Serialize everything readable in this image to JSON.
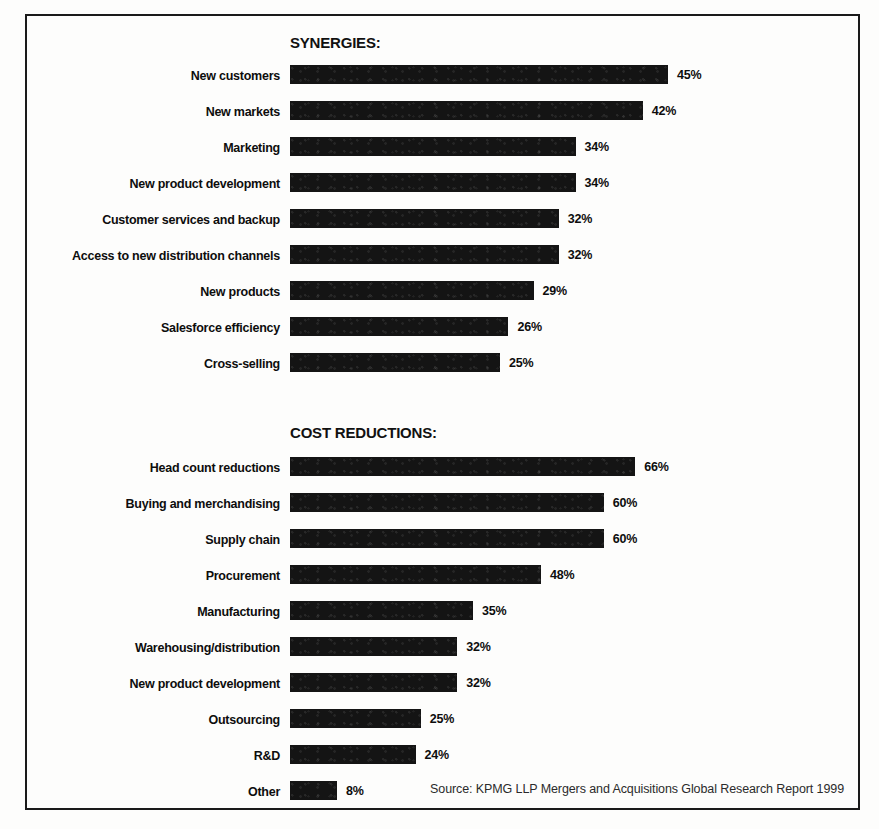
{
  "source_note": "Source: KPMG LLP Mergers and Acquisitions Global Research Report 1999",
  "charts": [
    {
      "title": "SYNERGIES:",
      "rows": [
        {
          "label": "New customers",
          "value": "45%"
        },
        {
          "label": "New markets",
          "value": "42%"
        },
        {
          "label": "Marketing",
          "value": "34%"
        },
        {
          "label": "New product development",
          "value": "34%"
        },
        {
          "label": "Customer services and backup",
          "value": "32%"
        },
        {
          "label": "Access to new distribution channels",
          "value": "32%"
        },
        {
          "label": "New products",
          "value": "29%"
        },
        {
          "label": "Salesforce efficiency",
          "value": "26%"
        },
        {
          "label": "Cross-selling",
          "value": "25%"
        }
      ]
    },
    {
      "title": "COST REDUCTIONS:",
      "rows": [
        {
          "label": "Head count reductions",
          "value": "66%"
        },
        {
          "label": "Buying and merchandising",
          "value": "60%"
        },
        {
          "label": "Supply chain",
          "value": "60%"
        },
        {
          "label": "Procurement",
          "value": "48%"
        },
        {
          "label": "Manufacturing",
          "value": "35%"
        },
        {
          "label": "Warehousing/distribution",
          "value": "32%"
        },
        {
          "label": "New product development",
          "value": "32%"
        },
        {
          "label": "Outsourcing",
          "value": "25%"
        },
        {
          "label": "R&D",
          "value": "24%"
        },
        {
          "label": "Other",
          "value": "8%"
        }
      ]
    }
  ],
  "chart_data": [
    {
      "type": "bar",
      "orientation": "horizontal",
      "title": "SYNERGIES:",
      "xlabel": "",
      "ylabel": "",
      "xlim": [
        0,
        45
      ],
      "grid": false,
      "legend": false,
      "value_suffix": "%",
      "px_per_unit": 8.4,
      "categories": [
        "New customers",
        "New markets",
        "Marketing",
        "New product development",
        "Customer services and backup",
        "Access to new distribution channels",
        "New products",
        "Salesforce efficiency",
        "Cross-selling"
      ],
      "values": [
        45,
        42,
        34,
        34,
        32,
        32,
        29,
        26,
        25
      ]
    },
    {
      "type": "bar",
      "orientation": "horizontal",
      "title": "COST REDUCTIONS:",
      "xlabel": "",
      "ylabel": "",
      "xlim": [
        0,
        66
      ],
      "grid": false,
      "legend": false,
      "value_suffix": "%",
      "px_per_unit": 5.23,
      "min_bar_px": 47,
      "categories": [
        "Head count reductions",
        "Buying and merchandising",
        "Supply chain",
        "Procurement",
        "Manufacturing",
        "Warehousing/distribution",
        "New product development",
        "Outsourcing",
        "R&D",
        "Other"
      ],
      "values": [
        66,
        60,
        60,
        48,
        35,
        32,
        32,
        25,
        24,
        8
      ]
    }
  ]
}
